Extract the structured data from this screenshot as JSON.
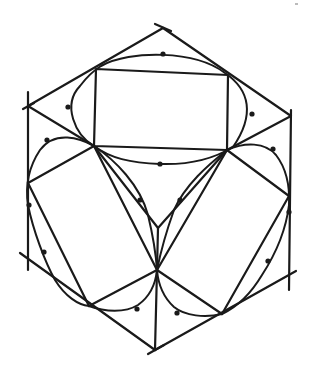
{
  "diagram": {
    "title": "",
    "stroke_color": "#1a1a1a",
    "background": "#ffffff",
    "hexagon": [
      [
        163,
        28
      ],
      [
        291,
        116
      ],
      [
        289,
        275
      ],
      [
        155,
        350
      ],
      [
        25,
        260
      ],
      [
        28,
        106
      ]
    ],
    "faces": {
      "top": {
        "rect": [
          [
            96,
            69
          ],
          [
            228,
            75
          ],
          [
            227,
            150
          ],
          [
            94,
            146
          ]
        ]
      },
      "left": {},
      "right": {}
    },
    "center_vertex": [
      157,
      268
    ],
    "labels": []
  }
}
